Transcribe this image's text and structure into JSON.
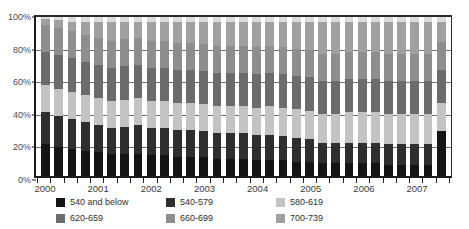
{
  "chart_data": {
    "type": "bar",
    "stacked": true,
    "normalized": "100%",
    "title": "",
    "subtitle": "",
    "xlabel": "",
    "ylabel": "",
    "ylim": [
      0,
      100
    ],
    "ytick_labels": [
      "0%",
      "20%",
      "40%",
      "60%",
      "80%",
      "100%"
    ],
    "ytick_values": [
      0,
      20,
      40,
      60,
      80,
      100
    ],
    "grid": true,
    "grid_axis": "y",
    "legend_position": "bottom",
    "x_year_labels": [
      "2000",
      "2001",
      "2002",
      "2003",
      "2004",
      "2005",
      "2006",
      "2007"
    ],
    "categories": [
      "2000 Q1",
      "2000 Q2",
      "2000 Q3",
      "2000 Q4",
      "2001 Q1",
      "2001 Q2",
      "2001 Q3",
      "2001 Q4",
      "2002 Q1",
      "2002 Q2",
      "2002 Q3",
      "2002 Q4",
      "2003 Q1",
      "2003 Q2",
      "2003 Q3",
      "2003 Q4",
      "2004 Q1",
      "2004 Q2",
      "2004 Q3",
      "2004 Q4",
      "2005 Q1",
      "2005 Q2",
      "2005 Q3",
      "2005 Q4",
      "2006 Q1",
      "2006 Q2",
      "2006 Q3",
      "2006 Q4",
      "2007 Q1",
      "2007 Q2",
      "2007 Q3"
    ],
    "series": [
      {
        "name": "540 and below",
        "color": "#141414",
        "values": [
          20,
          18,
          17,
          16,
          15,
          14,
          14,
          14,
          13,
          13,
          12,
          12,
          12,
          11,
          11,
          11,
          10,
          10,
          10,
          9,
          9,
          8,
          8,
          8,
          8,
          8,
          7,
          7,
          7,
          7,
          28
        ]
      },
      {
        "name": "540-579",
        "color": "#2e2e2e",
        "values": [
          20,
          20,
          19,
          18,
          17,
          16,
          17,
          18,
          17,
          17,
          17,
          17,
          16,
          16,
          16,
          16,
          16,
          16,
          15,
          15,
          14,
          13,
          13,
          13,
          13,
          13,
          13,
          13,
          13,
          13,
          0
        ]
      },
      {
        "name": "580-619",
        "color": "#c3c3c3",
        "values": [
          17,
          17,
          17,
          17,
          17,
          17,
          17,
          17,
          17,
          17,
          17,
          17,
          17,
          17,
          17,
          17,
          17,
          18,
          18,
          18,
          18,
          18,
          18,
          19,
          19,
          19,
          19,
          19,
          19,
          19,
          18
        ]
      },
      {
        "name": "620-659",
        "color": "#6b6b6b",
        "values": [
          21,
          21,
          21,
          21,
          21,
          21,
          21,
          21,
          21,
          21,
          21,
          21,
          21,
          21,
          21,
          21,
          21,
          21,
          21,
          21,
          21,
          21,
          21,
          21,
          21,
          21,
          21,
          21,
          21,
          21,
          21
        ]
      },
      {
        "name": "660-699",
        "color": "#8e8e8e",
        "values": [
          17,
          17,
          17,
          17,
          17,
          17,
          17,
          17,
          17,
          17,
          17,
          17,
          17,
          17,
          17,
          17,
          17,
          17,
          17,
          17,
          17,
          17,
          17,
          17,
          17,
          17,
          17,
          17,
          17,
          17,
          17
        ]
      },
      {
        "name": "700-739",
        "color": "#a0a0a0",
        "values": [
          4,
          5,
          6,
          8,
          10,
          12,
          11,
          10,
          12,
          12,
          13,
          13,
          14,
          15,
          15,
          15,
          16,
          15,
          16,
          17,
          18,
          20,
          20,
          19,
          19,
          19,
          20,
          20,
          20,
          20,
          13
        ]
      },
      {
        "name": "740 and above",
        "color": "#dcdcdc",
        "values": [
          1,
          2,
          3,
          3,
          3,
          3,
          3,
          3,
          3,
          3,
          3,
          3,
          3,
          3,
          3,
          3,
          3,
          3,
          3,
          3,
          3,
          3,
          3,
          3,
          3,
          3,
          3,
          3,
          3,
          3,
          3
        ]
      }
    ]
  }
}
